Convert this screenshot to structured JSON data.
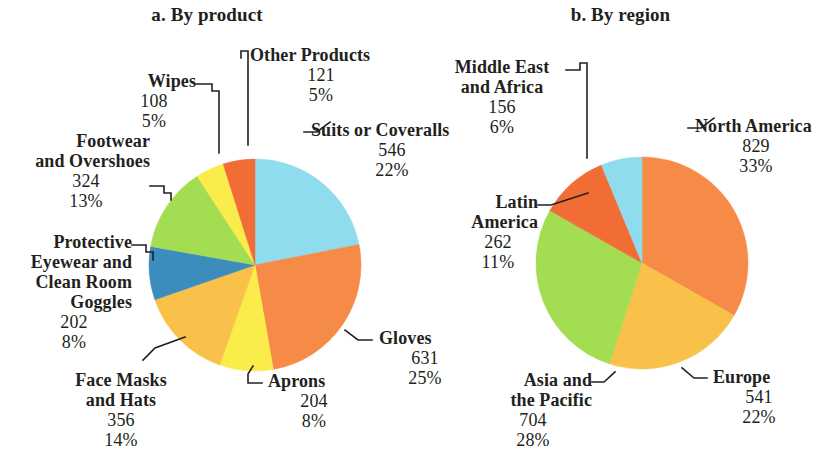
{
  "figure": {
    "panels": [
      {
        "id": "product",
        "title": "a. By product"
      },
      {
        "id": "region",
        "title": "b. By region"
      }
    ]
  },
  "chart_data": [
    {
      "type": "pie",
      "title": "a. By product",
      "legend_position": "callout-labels",
      "total": 2492,
      "categories": [
        "Suits or Coveralls",
        "Gloves",
        "Aprons",
        "Face Masks and Hats",
        "Protective Eyewear and Clean Room Goggles",
        "Footwear and Overshoes",
        "Wipes",
        "Other Products"
      ],
      "values": [
        546,
        631,
        204,
        356,
        202,
        324,
        108,
        121
      ],
      "percents": [
        "22%",
        "25%",
        "8%",
        "14%",
        "8%",
        "13%",
        "5%",
        "5%"
      ],
      "colors": [
        "#8fdcef",
        "#f68b48",
        "#faec4a",
        "#f9c04a",
        "#3d8cbe",
        "#a3dd52",
        "#faec4a",
        "#f26c36"
      ],
      "slices": [
        {
          "label": "Suits or Coveralls",
          "label_lines": "Suits or Coveralls",
          "value": "546",
          "percent": "22%",
          "color": "#8fdcef"
        },
        {
          "label": "Gloves",
          "label_lines": "Gloves",
          "value": "631",
          "percent": "25%",
          "color": "#f68b48"
        },
        {
          "label": "Aprons",
          "label_lines": "Aprons",
          "value": "204",
          "percent": "8%",
          "color": "#faec4a"
        },
        {
          "label": "Face Masks and Hats",
          "label_lines": "Face Masks\nand Hats",
          "value": "356",
          "percent": "14%",
          "color": "#f9c04a"
        },
        {
          "label": "Protective Eyewear and Clean Room Goggles",
          "label_lines": "Protective\nEyewear and\nClean Room\nGoggles",
          "value": "202",
          "percent": "8%",
          "color": "#3d8cbe"
        },
        {
          "label": "Footwear and Overshoes",
          "label_lines": "Footwear\nand Overshoes",
          "value": "324",
          "percent": "13%",
          "color": "#a3dd52"
        },
        {
          "label": "Wipes",
          "label_lines": "Wipes",
          "value": "108",
          "percent": "5%",
          "color": "#faec4a"
        },
        {
          "label": "Other Products",
          "label_lines": "Other Products",
          "value": "121",
          "percent": "5%",
          "color": "#f26c36"
        }
      ]
    },
    {
      "type": "pie",
      "title": "b. By region",
      "legend_position": "callout-labels",
      "total": 2492,
      "categories": [
        "North America",
        "Europe",
        "Asia and the Pacific",
        "Latin America",
        "Middle East and Africa"
      ],
      "values": [
        829,
        541,
        704,
        262,
        156
      ],
      "percents": [
        "33%",
        "22%",
        "28%",
        "11%",
        "6%"
      ],
      "colors": [
        "#f68b48",
        "#f9c04a",
        "#a3dd52",
        "#f26c36",
        "#8fdcef"
      ],
      "slices": [
        {
          "label": "North America",
          "label_lines": "North America",
          "value": "829",
          "percent": "33%",
          "color": "#f68b48"
        },
        {
          "label": "Europe",
          "label_lines": "Europe",
          "value": "541",
          "percent": "22%",
          "color": "#f9c04a"
        },
        {
          "label": "Asia and the Pacific",
          "label_lines": "Asia and\nthe Pacific",
          "value": "704",
          "percent": "28%",
          "color": "#a3dd52"
        },
        {
          "label": "Latin America",
          "label_lines": "Latin\nAmerica",
          "value": "262",
          "percent": "11%",
          "color": "#f26c36"
        },
        {
          "label": "Middle East and Africa",
          "label_lines": "Middle East\nand Africa",
          "value": "156",
          "percent": "6%",
          "color": "#8fdcef"
        }
      ]
    }
  ]
}
